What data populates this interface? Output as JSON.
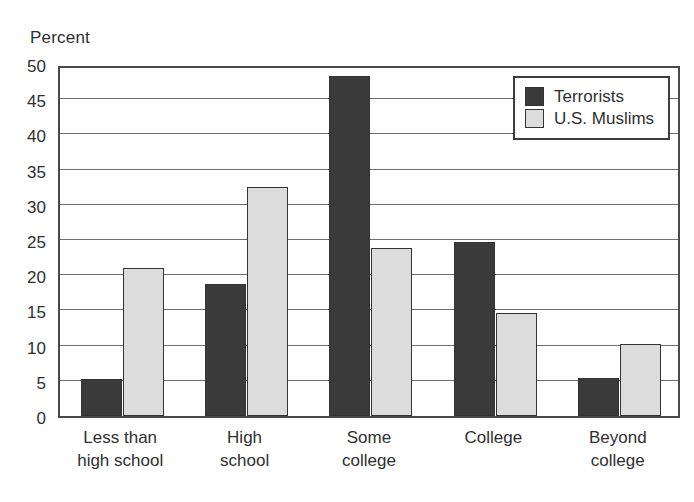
{
  "chart_data": {
    "type": "bar",
    "title": "",
    "subtitle": "",
    "xlabel": "",
    "ylabel": "Percent",
    "ylim": [
      0,
      50
    ],
    "ytick_step": 5,
    "yticks": [
      0,
      5,
      10,
      15,
      20,
      25,
      30,
      35,
      40,
      45,
      50
    ],
    "ytick_labels": [
      "0",
      "5",
      "10",
      "15",
      "20",
      "25",
      "30",
      "35",
      "40",
      "45",
      "50"
    ],
    "grid": true,
    "grid_axis": "y",
    "legend_position": "top-right",
    "categories": [
      "Less than high school",
      "High school",
      "Some college",
      "College",
      "Beyond college"
    ],
    "category_lines": [
      [
        "Less than",
        "high school"
      ],
      [
        "High",
        "school"
      ],
      [
        "Some",
        "college"
      ],
      [
        "College",
        ""
      ],
      [
        "Beyond",
        "college"
      ]
    ],
    "series": [
      {
        "name": "Terrorists",
        "color": "#3a3a3a",
        "values": [
          5.2,
          18.7,
          48.3,
          24.7,
          5.4
        ]
      },
      {
        "name": "U.S. Muslims",
        "color": "#dcdcdc",
        "values": [
          21.0,
          32.6,
          23.8,
          14.7,
          10.2
        ]
      }
    ]
  },
  "legend": {
    "entries": [
      {
        "label": "Terrorists"
      },
      {
        "label": "U.S. Muslims"
      }
    ]
  }
}
